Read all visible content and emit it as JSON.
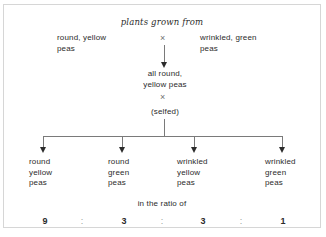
{
  "figure": {
    "title": "plants grown from",
    "cross_symbol": "×",
    "parents": [
      {
        "name": "parent-left",
        "text": "round, yellow\npeas"
      },
      {
        "name": "parent-right",
        "text": "wrinkled, green\npeas"
      }
    ],
    "f1": {
      "text": "all round,\nyellow peas"
    },
    "selfed_label": "(selfed)",
    "offspring": [
      {
        "text": "round\nyellow\npeas"
      },
      {
        "text": "round\ngreen\npeas"
      },
      {
        "text": "wrinkled\nyellow\npeas"
      },
      {
        "text": "wrinkled\ngreen\npeas"
      }
    ],
    "ratio_label": "in the ratio of",
    "ratio": {
      "values": [
        "9",
        "3",
        "3",
        "1"
      ],
      "separator": ":"
    },
    "colors": {
      "text": "#2b2b2b",
      "line": "#7a7a7a",
      "muted": "#9a9a9a",
      "border": "#d6d6d6",
      "background": "#ffffff"
    }
  }
}
